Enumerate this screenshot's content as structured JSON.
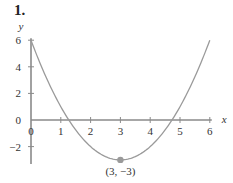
{
  "problem": {
    "number": "1."
  },
  "chart_data": {
    "type": "line",
    "title": "",
    "function": "y = (x - 3)^2 - 3",
    "xlabel": "x",
    "ylabel": "y",
    "xlim": [
      0,
      6
    ],
    "ylim": [
      -3,
      6
    ],
    "x_ticks": [
      0,
      1,
      2,
      3,
      4,
      5,
      6
    ],
    "x_tick_labels": [
      "0",
      "1",
      "2",
      "3",
      "4",
      "5",
      "6"
    ],
    "y_ticks": [
      -2,
      0,
      2,
      4,
      6
    ],
    "y_tick_labels": [
      "−2",
      "0",
      "2",
      "4",
      "6"
    ],
    "grid": false,
    "series": [
      {
        "name": "parabola",
        "x": [
          0,
          0.5,
          1,
          1.5,
          2,
          2.5,
          3,
          3.5,
          4,
          4.5,
          5,
          5.5,
          6
        ],
        "y": [
          6,
          3.25,
          1,
          -0.75,
          -2,
          -2.75,
          -3,
          -2.75,
          -2,
          -0.75,
          1,
          3.25,
          6
        ]
      }
    ],
    "annotations": [
      {
        "x": 3,
        "y": -3,
        "label": "(3, −3)",
        "marker": "dot"
      }
    ],
    "colors": {
      "curve": "#9a9a9a",
      "axis": "#8a8a8a",
      "point": "#9a9a9a"
    }
  }
}
